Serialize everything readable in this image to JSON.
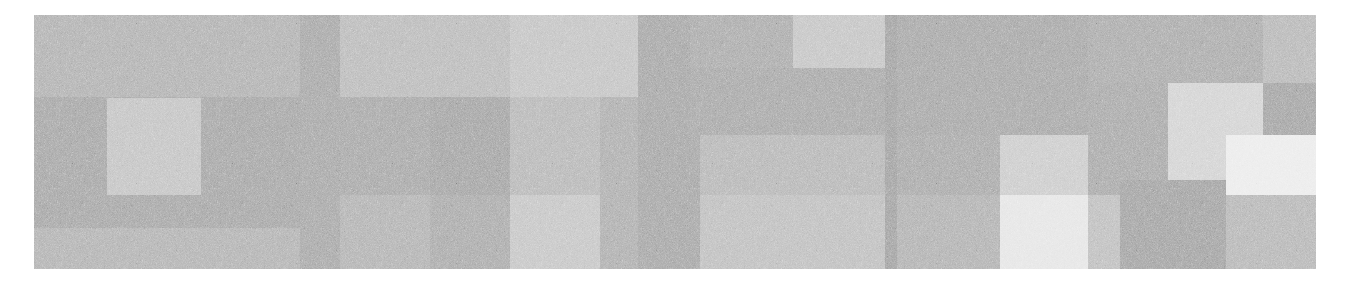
{
  "image": {
    "kind": "abstract-grayscale-block-mosaic",
    "noise": "fine-grain",
    "bounds": {
      "x": 34,
      "y": 15,
      "width": 1282,
      "height": 254
    },
    "background": "#b0b0b0",
    "blocks": [
      {
        "x": 0,
        "y": 0,
        "w": 306,
        "h": 82,
        "color": "#b3b3b3"
      },
      {
        "x": 0,
        "y": 82,
        "w": 306,
        "h": 131,
        "color": "#a8a8a8"
      },
      {
        "x": 0,
        "y": 213,
        "w": 306,
        "h": 41,
        "color": "#b4b4b4"
      },
      {
        "x": 73,
        "y": 83,
        "w": 94,
        "h": 97,
        "color": "#c5c5c5"
      },
      {
        "x": 266,
        "y": 0,
        "w": 40,
        "h": 254,
        "color": "#a9a9a9"
      },
      {
        "x": 306,
        "y": 0,
        "w": 170,
        "h": 82,
        "color": "#bcbcbc"
      },
      {
        "x": 306,
        "y": 82,
        "w": 170,
        "h": 98,
        "color": "#aaaaaa"
      },
      {
        "x": 396,
        "y": 82,
        "w": 80,
        "h": 98,
        "color": "#a6a6a6"
      },
      {
        "x": 306,
        "y": 180,
        "w": 90,
        "h": 74,
        "color": "#b4b4b4"
      },
      {
        "x": 396,
        "y": 180,
        "w": 80,
        "h": 74,
        "color": "#acacac"
      },
      {
        "x": 476,
        "y": 0,
        "w": 128,
        "h": 82,
        "color": "#c5c5c5"
      },
      {
        "x": 476,
        "y": 82,
        "w": 90,
        "h": 98,
        "color": "#b9b9b9"
      },
      {
        "x": 476,
        "y": 180,
        "w": 90,
        "h": 74,
        "color": "#c7c7c7"
      },
      {
        "x": 566,
        "y": 82,
        "w": 38,
        "h": 172,
        "color": "#b0b0b0"
      },
      {
        "x": 604,
        "y": 0,
        "w": 62,
        "h": 254,
        "color": "#a8a8a8"
      },
      {
        "x": 656,
        "y": 0,
        "w": 103,
        "h": 53,
        "color": "#adadad"
      },
      {
        "x": 759,
        "y": 0,
        "w": 92,
        "h": 53,
        "color": "#c6c6c6"
      },
      {
        "x": 656,
        "y": 53,
        "w": 195,
        "h": 67,
        "color": "#aaaaaa"
      },
      {
        "x": 666,
        "y": 120,
        "w": 185,
        "h": 60,
        "color": "#b8b8b8"
      },
      {
        "x": 666,
        "y": 180,
        "w": 185,
        "h": 74,
        "color": "#c0c0c0"
      },
      {
        "x": 851,
        "y": 0,
        "w": 12,
        "h": 254,
        "color": "#a4a4a4"
      },
      {
        "x": 863,
        "y": 0,
        "w": 191,
        "h": 120,
        "color": "#a9a9a9"
      },
      {
        "x": 863,
        "y": 120,
        "w": 103,
        "h": 60,
        "color": "#ababab"
      },
      {
        "x": 966,
        "y": 120,
        "w": 88,
        "h": 60,
        "color": "#cdcdcd"
      },
      {
        "x": 863,
        "y": 180,
        "w": 103,
        "h": 74,
        "color": "#b3b3b3"
      },
      {
        "x": 966,
        "y": 180,
        "w": 88,
        "h": 74,
        "color": "#e6e6e6"
      },
      {
        "x": 1054,
        "y": 0,
        "w": 175,
        "h": 68,
        "color": "#adadad"
      },
      {
        "x": 1229,
        "y": 0,
        "w": 53,
        "h": 68,
        "color": "#b9b9b9"
      },
      {
        "x": 1054,
        "y": 68,
        "w": 80,
        "h": 112,
        "color": "#ababab"
      },
      {
        "x": 1134,
        "y": 68,
        "w": 95,
        "h": 97,
        "color": "#d4d4d4"
      },
      {
        "x": 1229,
        "y": 68,
        "w": 53,
        "h": 52,
        "color": "#a6a6a6"
      },
      {
        "x": 1192,
        "y": 120,
        "w": 90,
        "h": 60,
        "color": "#ececec"
      },
      {
        "x": 1134,
        "y": 165,
        "w": 58,
        "h": 15,
        "color": "#d2d2d2"
      },
      {
        "x": 1054,
        "y": 180,
        "w": 32,
        "h": 74,
        "color": "#c0c0c0"
      },
      {
        "x": 1086,
        "y": 165,
        "w": 106,
        "h": 89,
        "color": "#a5a5a5"
      },
      {
        "x": 1192,
        "y": 180,
        "w": 90,
        "h": 74,
        "color": "#b8b8b8"
      }
    ]
  }
}
